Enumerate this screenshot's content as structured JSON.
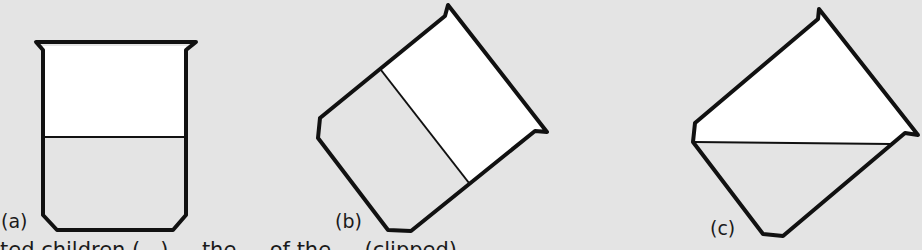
{
  "figure": {
    "colors": {
      "background": "#e4e4e4",
      "air": "#ffffff",
      "liquid": "#e4e4e4",
      "outline": "#111111"
    },
    "panels": [
      {
        "id": "a",
        "label": "(a)",
        "description": "upright beaker, liquid surface horizontal",
        "beaker_outline": "36,42 196,42 186,50 186,215 173,230 57,230 43,215 43,50",
        "air_region": "43,46 186,46 186,137 43,137",
        "liquid_line": [
          43,
          137,
          186,
          137
        ]
      },
      {
        "id": "b",
        "label": "(b)",
        "description": "tilted beaker, liquid line drawn parallel to the base (incorrect)",
        "beaker_outline": "448,5 547,132 535,131 411,231 388,230 318,138 320,118 445,16",
        "air_region": "445,16 448,8 543,128 535,131 469,183 381,70",
        "liquid_line": [
          381,
          70,
          469,
          183
        ]
      },
      {
        "id": "c",
        "label": "(c)",
        "description": "tilted beaker, liquid surface stays horizontal (correct)",
        "beaker_outline": "819,9 918,135 905,133 783,236 763,234 693,142 695,123 818,19",
        "air_region": "818,19 820,12 914,132 905,133 891,144 694,142 695,123",
        "liquid_line": [
          694,
          142,
          891,
          144
        ]
      }
    ]
  },
  "caption": {
    "text": "ted children (...) ... the ... of the ... (clipped)"
  }
}
